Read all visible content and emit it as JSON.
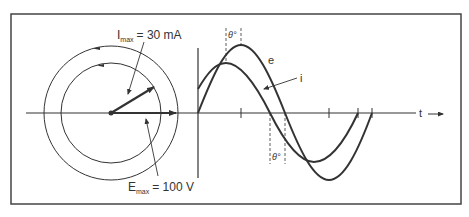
{
  "phasor": {
    "i_label": "I",
    "i_sub": "max",
    "i_value": "= 30 mA",
    "e_label": "E",
    "e_sub": "max",
    "e_value": "= 100 V"
  },
  "waveform": {
    "e_label": "e",
    "i_label": "i",
    "theta_top": "θ°",
    "theta_bottom": "θ°",
    "t_label": "t"
  },
  "colors": {
    "line": "#333333",
    "frame": "#444444",
    "background": "#ffffff"
  }
}
